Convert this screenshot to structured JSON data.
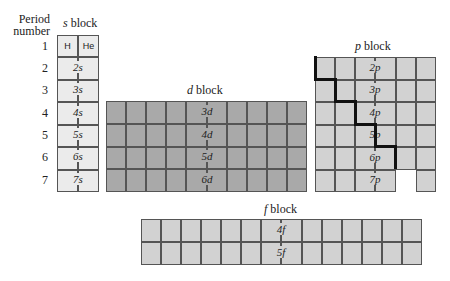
{
  "header": {
    "period_label_line1": "Period",
    "period_label_line2": "number"
  },
  "periods": [
    "1",
    "2",
    "3",
    "4",
    "5",
    "6",
    "7"
  ],
  "s_block": {
    "title_letter": "s",
    "title_suffix": " block",
    "row1": [
      "H",
      "He"
    ],
    "rows": [
      "2s",
      "3s",
      "4s",
      "5s",
      "6s",
      "7s"
    ],
    "color": "#ebebeb"
  },
  "d_block": {
    "title_letter": "d",
    "title_suffix": " block",
    "rows": [
      "3d",
      "4d",
      "5d",
      "6d"
    ],
    "columns": 10,
    "color": "#a9a9a9"
  },
  "p_block": {
    "title_letter": "p",
    "title_suffix": " block",
    "rows": [
      "2p",
      "3p",
      "4p",
      "5p",
      "6p",
      "7p"
    ],
    "columns": 6,
    "color": "#d2d2d2"
  },
  "f_block": {
    "title_letter": "f",
    "title_suffix": " block",
    "rows": [
      "4f",
      "5f"
    ],
    "columns": 14,
    "color": "#d2d2d2"
  }
}
